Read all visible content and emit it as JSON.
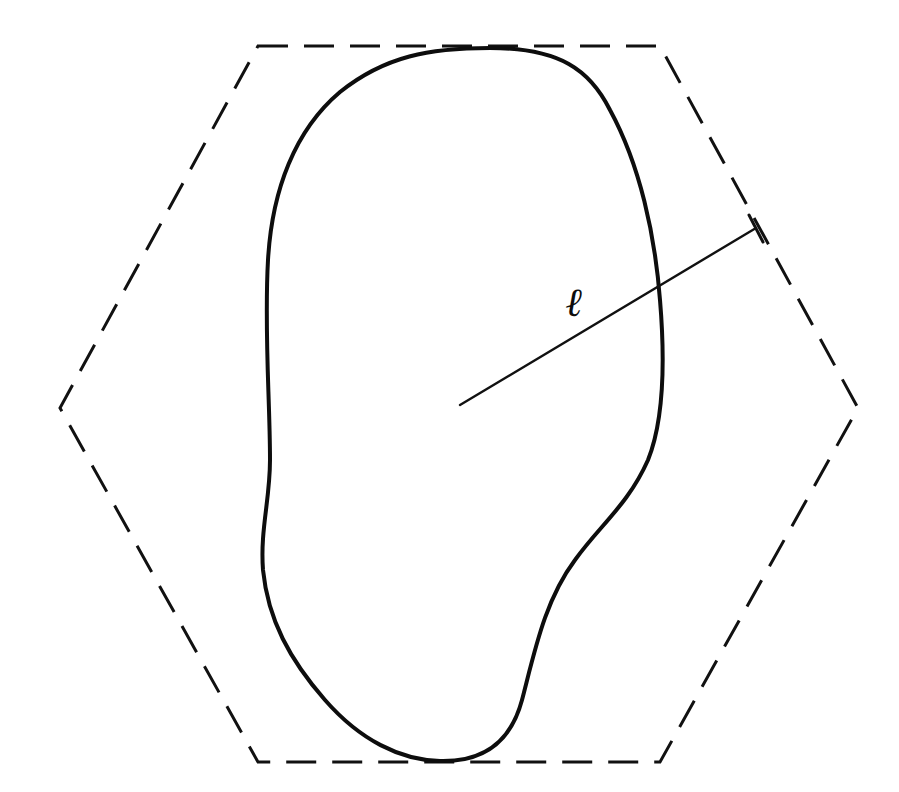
{
  "diagram": {
    "hexagon": {
      "style": "dashed",
      "vertices": [
        [
          258,
          46
        ],
        [
          660,
          46
        ],
        [
          858,
          408
        ],
        [
          660,
          762
        ],
        [
          258,
          762
        ],
        [
          60,
          408
        ]
      ]
    },
    "body": {
      "style": "solid",
      "touches_hexagon": [
        "top edge",
        "bottom edge"
      ]
    },
    "segment": {
      "label": "ℓ",
      "from": [
        460,
        405
      ],
      "to": [
        756,
        228
      ],
      "crosses": "body outline"
    },
    "colors": {
      "stroke": "#111111",
      "background": "#ffffff"
    }
  }
}
